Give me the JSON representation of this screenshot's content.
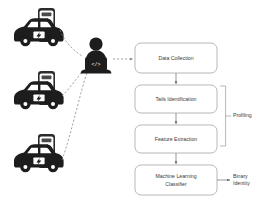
{
  "diagram": {
    "colors": {
      "box_stroke": "#9a9a9a",
      "box_fill": "#ffffff",
      "connector": "#6a6a6a",
      "dashed_link": "#7d7d7d",
      "text": "#3a3a3a",
      "silhouette": "#1d1d1d",
      "background": "#ffffff"
    },
    "flow_boxes": [
      {
        "id": "data-collection",
        "label": "Data Collection"
      },
      {
        "id": "tails-identification",
        "label": "Tails Identification"
      },
      {
        "id": "feature-extraction",
        "label": "Feature Extraction"
      },
      {
        "id": "ml-classifier",
        "label_line1": "Machine Learning",
        "label_line2": "Classifier"
      }
    ],
    "annotations": {
      "profiling": "Profiling",
      "output_line1": "Binary",
      "output_line2": "Identity"
    },
    "actor": {
      "name": "attacker-with-laptop",
      "code_glyph": "</>"
    },
    "sources": [
      {
        "id": "ev-unit-1",
        "name": "electric-vehicle-charging-unit"
      },
      {
        "id": "ev-unit-2",
        "name": "electric-vehicle-charging-unit"
      },
      {
        "id": "ev-unit-3",
        "name": "electric-vehicle-charging-unit"
      }
    ]
  }
}
